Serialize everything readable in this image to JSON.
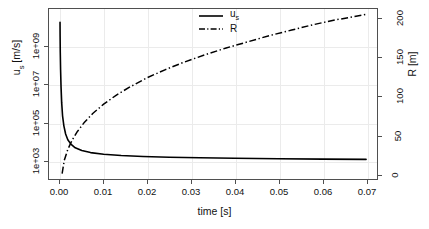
{
  "chart_data": {
    "type": "line",
    "title": "",
    "xlabel": "time [s]",
    "ylabel": "u_s [m/s]",
    "ylabel_right": "R [m]",
    "grid": true,
    "legend_position": "top-center",
    "xlim": [
      -0.0025,
      0.0725
    ],
    "x_ticks": [
      "0.00",
      "0.01",
      "0.02",
      "0.03",
      "0.04",
      "0.05",
      "0.06",
      "0.07"
    ],
    "x_tick_values": [
      0.0,
      0.01,
      0.02,
      0.03,
      0.04,
      0.05,
      0.06,
      0.07
    ],
    "left_axis": {
      "scale": "log",
      "ylim": [
        100.0,
        100000000000.0
      ],
      "ticks": [
        "1e+03",
        "1e+05",
        "1e+07",
        "1e+09"
      ],
      "tick_values": [
        1000,
        100000,
        10000000,
        1000000000
      ]
    },
    "right_axis": {
      "scale": "linear",
      "ylim": [
        -6,
        212
      ],
      "ticks": [
        "0",
        "50",
        "100",
        "150",
        "200"
      ],
      "tick_values": [
        0,
        50,
        100,
        150,
        200
      ]
    },
    "series": [
      {
        "name": "u_s",
        "label": "u_s",
        "axis": "left",
        "style": "solid",
        "color": "#000000",
        "x": [
          2e-05,
          4e-05,
          8e-05,
          0.00015,
          0.00025,
          0.0004,
          0.0006,
          0.0009,
          0.0013,
          0.0018,
          0.0025,
          0.0035,
          0.005,
          0.007,
          0.01,
          0.014,
          0.019,
          0.025,
          0.032,
          0.04,
          0.05,
          0.06,
          0.07
        ],
        "y": [
          20000000000.0,
          3500000000.0,
          500000000.0,
          60000000.0,
          8000000.0,
          1100000.0,
          220000.0,
          65000.0,
          24000.0,
          12000.0,
          7000.0,
          4500.0,
          3200.0,
          2500.0,
          2050.0,
          1750.0,
          1550.0,
          1420.0,
          1320.0,
          1250.0,
          1180.0,
          1130.0,
          1090.0
        ]
      },
      {
        "name": "R",
        "label": "R",
        "axis": "right",
        "style": "dashdot",
        "color": "#000000",
        "x": [
          0.0005,
          0.001,
          0.0018,
          0.0028,
          0.004,
          0.0055,
          0.0075,
          0.01,
          0.013,
          0.016,
          0.02,
          0.024,
          0.028,
          0.033,
          0.038,
          0.043,
          0.048,
          0.053,
          0.058,
          0.063,
          0.068,
          0.07
        ],
        "y": [
          1,
          18,
          32,
          44,
          55,
          66,
          78,
          90,
          102,
          112,
          124,
          134,
          143,
          153,
          162,
          170,
          178,
          185,
          192,
          198,
          203,
          205
        ]
      }
    ]
  },
  "axes": {
    "x_title": "time [s]",
    "y_left_title_main": "u",
    "y_left_title_sub": "s",
    "y_left_title_unit": " [m/s]",
    "y_right_title": "R [m]"
  },
  "legend": {
    "entries": [
      {
        "label_main": "u",
        "label_sub": "s",
        "style": "solid"
      },
      {
        "label_main": "R",
        "label_sub": "",
        "style": "dashdot"
      }
    ]
  },
  "colors": {
    "curve": "#000000",
    "frame": "#4f4f4f",
    "grid": "#ebebeb",
    "background": "#ffffff",
    "text": "#111111"
  }
}
